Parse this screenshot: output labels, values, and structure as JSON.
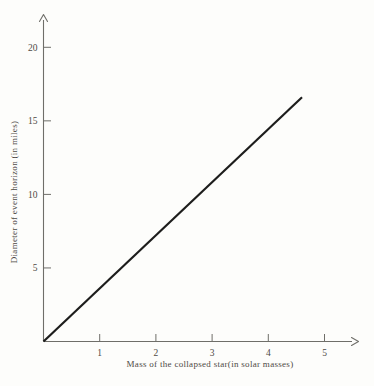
{
  "figure": {
    "background_color": "#fdfdfb",
    "axis_color": "#6f6e69",
    "text_color": "#4e4a45"
  },
  "chart_data": {
    "type": "line",
    "title": "",
    "xlabel": "Mass of the collapsed star(in solar masses)",
    "ylabel": "Diameter of event horizon (in miles)",
    "xlim": [
      0,
      5.6
    ],
    "ylim": [
      0,
      22.2
    ],
    "x_ticks": [
      1,
      2,
      3,
      4,
      5
    ],
    "y_ticks": [
      5,
      10,
      15,
      20
    ],
    "grid": false,
    "legend": false,
    "series": [
      {
        "name": "event-horizon-diameter-vs-mass",
        "color": "#1d1d1c",
        "width": 2.2,
        "points": [
          [
            0,
            0
          ],
          [
            4.6,
            16.6
          ]
        ]
      }
    ]
  }
}
